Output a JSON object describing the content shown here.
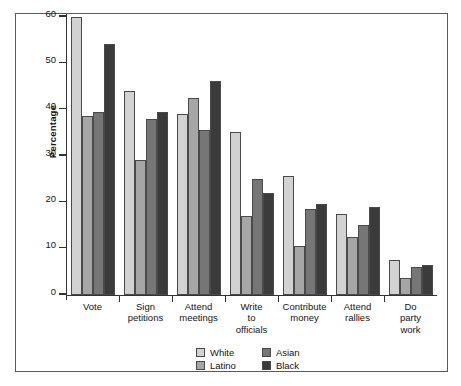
{
  "chart_data": {
    "type": "bar",
    "title": "",
    "xlabel": "",
    "ylabel": "Percentage",
    "ylim": [
      0,
      60
    ],
    "yticks": [
      0,
      10,
      20,
      30,
      40,
      50,
      60
    ],
    "ytick_labels": [
      "0",
      "10",
      "20",
      "30",
      "40",
      "50",
      "60"
    ],
    "grid": false,
    "legend_position": "bottom-center",
    "categories": [
      "Vote",
      "Sign\npetitions",
      "Attend\nmeetings",
      "Write\nto\nofficials",
      "Contribute\nmoney",
      "Attend\nrallies",
      "Do\nparty work"
    ],
    "series": [
      {
        "name": "White",
        "color": "#d2d2d2",
        "values": [
          60.0,
          44.0,
          39.0,
          35.0,
          25.5,
          17.5,
          7.5
        ]
      },
      {
        "name": "Latino",
        "color": "#a6a6a6",
        "values": [
          38.5,
          29.0,
          42.5,
          17.0,
          10.5,
          12.5,
          3.5
        ]
      },
      {
        "name": "Asian",
        "color": "#767676",
        "values": [
          39.5,
          38.0,
          35.5,
          25.0,
          18.5,
          15.0,
          6.0
        ]
      },
      {
        "name": "Black",
        "color": "#3b3b3b",
        "values": [
          54.0,
          39.5,
          46.0,
          22.0,
          19.5,
          19.0,
          6.5
        ]
      }
    ],
    "legend": [
      {
        "label": "White",
        "color": "#d2d2d2"
      },
      {
        "label": "Asian",
        "color": "#767676"
      },
      {
        "label": "Latino",
        "color": "#a6a6a6"
      },
      {
        "label": "Black",
        "color": "#3b3b3b"
      }
    ]
  }
}
